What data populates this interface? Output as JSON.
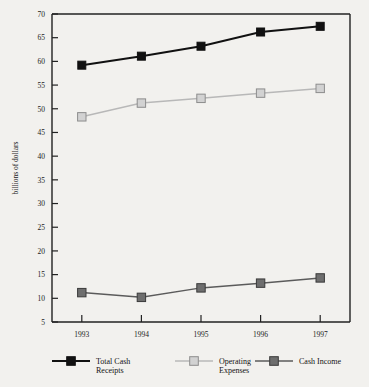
{
  "chart_data": {
    "type": "line",
    "title": "",
    "xlabel": "",
    "ylabel": "billions of dollars",
    "categories": [
      "1993",
      "1994",
      "1995",
      "1996",
      "1997"
    ],
    "ylim": [
      5,
      70
    ],
    "ytick_step": 5,
    "yticks": [
      5,
      10,
      15,
      20,
      25,
      30,
      35,
      40,
      45,
      50,
      55,
      60,
      65,
      70
    ],
    "grid": false,
    "legend_position": "bottom",
    "series": [
      {
        "name": "Total Cash Receipts",
        "label_lines": [
          "Total Cash",
          "Receipts"
        ],
        "color": "#111111",
        "marker": "filled-square",
        "marker_fill": "#111111",
        "marker_stroke": "#111111",
        "values": [
          59.2,
          61.1,
          63.2,
          66.2,
          67.4
        ]
      },
      {
        "name": "Operating Expenses",
        "label_lines": [
          "Operating",
          "Expenses"
        ],
        "color": "#b8b8b8",
        "marker": "open-square",
        "marker_fill": "#d2d2d2",
        "marker_stroke": "#8d8d8d",
        "values": [
          48.3,
          51.2,
          52.2,
          53.3,
          54.3
        ]
      },
      {
        "name": "Cash Income",
        "label_lines": [
          "Cash Income"
        ],
        "color": "#5b5b5b",
        "marker": "filled-square",
        "marker_fill": "#6e6e6e",
        "marker_stroke": "#3a3a3a",
        "values": [
          11.2,
          10.2,
          12.2,
          13.2,
          14.3
        ]
      }
    ]
  },
  "axis": {
    "y_title": "billions of dollars",
    "y_tick_labels": [
      "70",
      "65",
      "60",
      "55",
      "50",
      "45",
      "40",
      "35",
      "30",
      "25",
      "20",
      "15",
      "10",
      "5"
    ],
    "x_tick_labels": [
      "1993",
      "1994",
      "1995",
      "1996",
      "1997"
    ]
  },
  "legend": {
    "items": [
      {
        "line1": "Total Cash",
        "line2": "Receipts"
      },
      {
        "line1": "Operating",
        "line2": "Expenses"
      },
      {
        "line1": "Cash Income",
        "line2": ""
      }
    ]
  }
}
